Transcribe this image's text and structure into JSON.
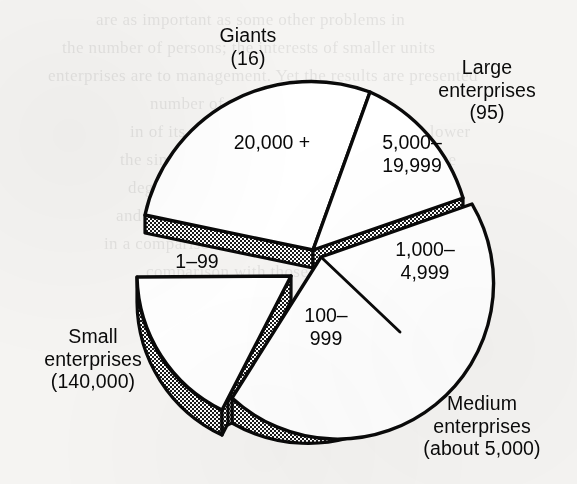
{
  "figure": {
    "background_color": "#f5f4f2",
    "ink_color": "#0a0a0a",
    "fill_color": "#ffffff",
    "shade_color": "#8f8f8f"
  },
  "callouts": {
    "giants": {
      "line1": "Giants",
      "line2": "(16)"
    },
    "large": {
      "line1": "Large",
      "line2": "enterprises",
      "line3": "(95)"
    },
    "medium": {
      "line1": "Medium",
      "line2": "enterprises",
      "line3": "(about 5,000)"
    },
    "small": {
      "line1": "Small",
      "line2": "enterprises",
      "line3": "(140,000)"
    }
  },
  "slice_labels": {
    "s20000": "20,000 +",
    "s5000": {
      "line1": "5,000–",
      "line2": "19,999"
    },
    "s1000": {
      "line1": "1,000–",
      "line2": "4,999"
    },
    "s100": {
      "line1": "100–",
      "line2": "999"
    },
    "s1": "1–99"
  },
  "ghost_text": [
    {
      "text": "are as important as some other problems in",
      "x": 96,
      "y": 6
    },
    {
      "text": "the number of persons; the interests of smaller units",
      "x": 62,
      "y": 34
    },
    {
      "text": "enterprises are to management. Yet the results are presented",
      "x": 48,
      "y": 62
    },
    {
      "text": "number of times the",
      "x": 150,
      "y": 90
    },
    {
      "text": "in of its the rest of the results to be much lower",
      "x": 130,
      "y": 118
    },
    {
      "text": "the single most significant factor that the force",
      "x": 120,
      "y": 146
    },
    {
      "text": "degree the relative number of the one and",
      "x": 128,
      "y": 174
    },
    {
      "text": "and it is not possible to say with remaining time",
      "x": 116,
      "y": 202
    },
    {
      "text": "in a comparison of the importance of a very large size",
      "x": 104,
      "y": 230
    },
    {
      "text": "comparison with those in other",
      "x": 146,
      "y": 258
    },
    {
      "text": "s Enterprises",
      "x": 300,
      "y": 400
    }
  ],
  "chart_data": {
    "type": "pie",
    "title": "",
    "categories": [
      "20,000 +",
      "5,000–19,999",
      "1,000–4,999",
      "100–999",
      "1–99"
    ],
    "group_labels": [
      "Giants (16)",
      "Large enterprises (95)",
      "Medium enterprises (about 5,000)",
      "Medium enterprises (about 5,000)",
      "Small enterprises (140,000)"
    ],
    "counts": [
      16,
      95,
      5000,
      5000,
      140000
    ],
    "count_labels": [
      "16",
      "95",
      "about 5,000",
      "about 5,000",
      "140,000"
    ],
    "slice_angles_deg": [
      100,
      58,
      62,
      68,
      72
    ],
    "exploded": [
      false,
      false,
      true,
      true,
      true
    ],
    "exploded_groups": [
      "Medium enterprises",
      "Small enterprises"
    ],
    "legend": "none",
    "grid": false,
    "style": "3d-exploded-pie",
    "note": "Slice sizes are schematic (equal-ish wedges), not proportional to the counts shown."
  }
}
